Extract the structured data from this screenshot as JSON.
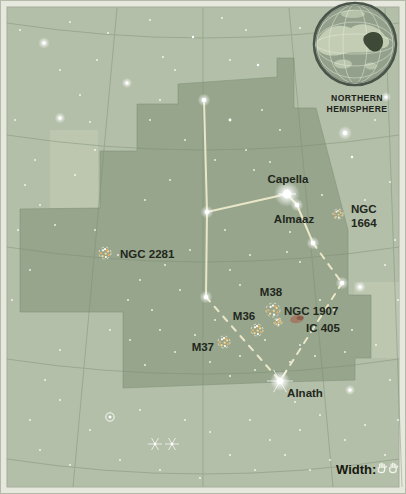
{
  "page": {
    "width": 406,
    "height": 494
  },
  "colors": {
    "frame": "#e6e8de",
    "frame_edge": "#b4b9aa",
    "map_bg": "#b4bfa9",
    "region_fill": "#96a58c",
    "region_edge": "#83947b",
    "light_patch": "#c4cdb6",
    "grid": "#7c8f74",
    "figure_line": "#f4eecf",
    "label_text": "#22271c",
    "star": "#ffffff",
    "cluster_dot_warm": "#ffd98e",
    "cluster_dot_deep": "#f2ae55",
    "cluster_ring": "#f0ead0",
    "nebula": "#a4735f",
    "inset_ring": "#49544a",
    "inset_ocean": "#93a28c",
    "inset_land": "#c6d0b6",
    "inset_marker": "#333f2c",
    "inset_graticule": "#e8edda",
    "hand": "#f2f4ec"
  },
  "map": {
    "region_points": [
      [
        178,
        84
      ],
      [
        277,
        77
      ],
      [
        277,
        58
      ],
      [
        294,
        58
      ],
      [
        294,
        108
      ],
      [
        316,
        108
      ],
      [
        348,
        230
      ],
      [
        348,
        295
      ],
      [
        371,
        295
      ],
      [
        371,
        358
      ],
      [
        355,
        358
      ],
      [
        355,
        380
      ],
      [
        280,
        382
      ],
      [
        123,
        388
      ],
      [
        123,
        312
      ],
      [
        20,
        312
      ],
      [
        20,
        209
      ],
      [
        100,
        208
      ],
      [
        100,
        151
      ],
      [
        137,
        151
      ],
      [
        137,
        104
      ],
      [
        178,
        104
      ]
    ],
    "light_patches": [
      {
        "x": 50,
        "y": 130,
        "w": 48,
        "h": 78
      },
      {
        "x": 354,
        "y": 282,
        "w": 45,
        "h": 76
      }
    ],
    "grid": {
      "dec_arc_sag_y": [
        38,
        150,
        262,
        374,
        474
      ],
      "arc_rise": 15,
      "arc_center_x": 203,
      "ra_lines": [
        [
          117,
          8,
          73,
          487
        ],
        [
          203,
          8,
          203,
          487
        ],
        [
          289,
          8,
          333,
          487
        ],
        [
          385,
          8,
          402,
          487
        ]
      ]
    },
    "figure_lines": {
      "solid": [
        [
          [
            204,
            100
          ],
          [
            207,
            212
          ]
        ],
        [
          [
            207,
            212
          ],
          [
            206,
            297
          ]
        ],
        [
          [
            207,
            212
          ],
          [
            287,
            194
          ]
        ],
        [
          [
            287,
            194
          ],
          [
            297,
            205
          ]
        ],
        [
          [
            297,
            205
          ],
          [
            313,
            243
          ]
        ]
      ],
      "dashed": [
        [
          [
            206,
            297
          ],
          [
            280,
            381
          ]
        ],
        [
          [
            313,
            243
          ],
          [
            342,
            283
          ]
        ],
        [
          [
            342,
            283
          ],
          [
            280,
            381
          ]
        ]
      ]
    },
    "labels": [
      {
        "id": "capella",
        "text": "Capella",
        "x": 288,
        "y": 183,
        "anchor": "middle"
      },
      {
        "id": "almaaz",
        "text": "Almaaz",
        "x": 294,
        "y": 223,
        "anchor": "middle"
      },
      {
        "id": "ngc1664-line1",
        "text": "NGC",
        "x": 351,
        "y": 213,
        "anchor": "start"
      },
      {
        "id": "ngc1664-line2",
        "text": "1664",
        "x": 351,
        "y": 227,
        "anchor": "start"
      },
      {
        "id": "ngc2281",
        "text": "NGC 2281",
        "x": 120,
        "y": 258,
        "anchor": "start"
      },
      {
        "id": "m38",
        "text": "M38",
        "x": 271,
        "y": 296,
        "anchor": "middle"
      },
      {
        "id": "m36",
        "text": "M36",
        "x": 244,
        "y": 320,
        "anchor": "middle"
      },
      {
        "id": "m37",
        "text": "M37",
        "x": 214,
        "y": 351,
        "anchor": "end"
      },
      {
        "id": "ngc1907",
        "text": "NGC 1907",
        "x": 284,
        "y": 315,
        "anchor": "start"
      },
      {
        "id": "ic405",
        "text": "IC 405",
        "x": 306,
        "y": 332,
        "anchor": "start"
      },
      {
        "id": "alnath",
        "text": "Alnath",
        "x": 305,
        "y": 397,
        "anchor": "middle"
      }
    ],
    "named_stars": [
      {
        "name": "capella",
        "x": 287,
        "y": 194,
        "type": "major"
      },
      {
        "name": "almaaz",
        "x": 297,
        "y": 205,
        "type": "bright"
      },
      {
        "name": "eta-aur",
        "x": 313,
        "y": 243,
        "type": "bright"
      },
      {
        "name": "iota-aur",
        "x": 342,
        "y": 283,
        "type": "bright"
      },
      {
        "name": "delta-aur",
        "x": 204,
        "y": 100,
        "type": "bright"
      },
      {
        "name": "menkalinan",
        "x": 207,
        "y": 212,
        "type": "bright"
      },
      {
        "name": "theta-aur",
        "x": 206,
        "y": 297,
        "type": "bright"
      },
      {
        "name": "alnath",
        "x": 280,
        "y": 381,
        "type": "major-spiked"
      }
    ],
    "stars": [
      [
        20,
        30,
        1
      ],
      [
        44,
        43,
        1.8
      ],
      [
        70,
        22,
        1
      ],
      [
        97,
        60,
        1
      ],
      [
        108,
        33,
        1
      ],
      [
        127,
        83,
        1.6
      ],
      [
        150,
        20,
        1
      ],
      [
        163,
        57,
        1
      ],
      [
        193,
        37,
        1.2
      ],
      [
        222,
        18,
        1
      ],
      [
        246,
        30,
        1
      ],
      [
        258,
        65,
        1.2
      ],
      [
        300,
        28,
        1
      ],
      [
        230,
        60,
        1
      ],
      [
        175,
        70,
        1
      ],
      [
        60,
        70,
        1
      ],
      [
        15,
        120,
        1
      ],
      [
        35,
        160,
        1
      ],
      [
        18,
        230,
        1
      ],
      [
        60,
        118,
        1.7
      ],
      [
        80,
        95,
        1
      ],
      [
        30,
        270,
        1
      ],
      [
        12,
        300,
        1
      ],
      [
        55,
        225,
        1
      ],
      [
        90,
        122,
        1
      ],
      [
        75,
        175,
        1
      ],
      [
        40,
        205,
        1
      ],
      [
        25,
        185,
        1
      ],
      [
        95,
        150,
        1
      ],
      [
        150,
        120,
        1
      ],
      [
        185,
        140,
        1
      ],
      [
        230,
        120,
        1.4
      ],
      [
        262,
        110,
        1
      ],
      [
        280,
        130,
        1
      ],
      [
        215,
        160,
        1
      ],
      [
        246,
        150,
        1
      ],
      [
        170,
        180,
        1
      ],
      [
        145,
        200,
        1
      ],
      [
        254,
        170,
        1
      ],
      [
        270,
        162,
        1
      ],
      [
        160,
        100,
        1
      ],
      [
        322,
        195,
        1
      ],
      [
        305,
        180,
        1
      ],
      [
        290,
        232,
        1
      ],
      [
        287,
        252,
        1
      ],
      [
        300,
        262,
        1
      ],
      [
        320,
        300,
        1
      ],
      [
        334,
        310,
        1
      ],
      [
        360,
        287,
        1.8
      ],
      [
        352,
        330,
        1
      ],
      [
        345,
        352,
        1
      ],
      [
        365,
        200,
        1
      ],
      [
        390,
        182,
        1
      ],
      [
        395,
        240,
        1
      ],
      [
        385,
        265,
        1
      ],
      [
        398,
        300,
        1
      ],
      [
        386,
        97,
        1.6
      ],
      [
        345,
        133,
        2.2
      ],
      [
        352,
        157,
        1.2
      ],
      [
        375,
        120,
        1
      ],
      [
        225,
        230,
        1
      ],
      [
        190,
        250,
        1
      ],
      [
        165,
        265,
        1
      ],
      [
        180,
        290,
        1
      ],
      [
        152,
        310,
        1
      ],
      [
        140,
        280,
        1
      ],
      [
        118,
        255,
        1
      ],
      [
        128,
        300,
        1
      ],
      [
        95,
        230,
        1
      ],
      [
        230,
        270,
        1
      ],
      [
        250,
        255,
        1
      ],
      [
        240,
        285,
        1
      ],
      [
        215,
        320,
        1
      ],
      [
        195,
        335,
        1
      ],
      [
        175,
        352,
        1
      ],
      [
        160,
        330,
        1
      ],
      [
        210,
        362,
        1
      ],
      [
        240,
        356,
        1
      ],
      [
        255,
        370,
        1
      ],
      [
        230,
        376,
        1
      ],
      [
        265,
        340,
        1
      ],
      [
        300,
        345,
        1
      ],
      [
        315,
        356,
        1
      ],
      [
        290,
        362,
        1
      ],
      [
        130,
        340,
        1
      ],
      [
        110,
        330,
        1
      ],
      [
        145,
        365,
        1
      ],
      [
        60,
        400,
        1
      ],
      [
        90,
        430,
        1
      ],
      [
        140,
        410,
        1
      ],
      [
        185,
        420,
        1
      ],
      [
        210,
        432,
        1
      ],
      [
        230,
        455,
        1
      ],
      [
        250,
        420,
        1
      ],
      [
        270,
        440,
        1
      ],
      [
        300,
        430,
        1
      ],
      [
        320,
        415,
        1
      ],
      [
        345,
        440,
        1
      ],
      [
        365,
        425,
        1
      ],
      [
        385,
        455,
        1
      ],
      [
        40,
        450,
        1
      ],
      [
        70,
        465,
        1
      ],
      [
        120,
        460,
        1
      ],
      [
        160,
        470,
        1
      ],
      [
        200,
        478,
        1
      ],
      [
        255,
        470,
        1
      ],
      [
        60,
        350,
        1
      ],
      [
        45,
        380,
        1
      ],
      [
        30,
        420,
        1
      ],
      [
        350,
        390,
        1.6
      ],
      [
        330,
        460,
        1
      ],
      [
        295,
        402,
        1
      ],
      [
        376,
        345,
        1
      ],
      [
        398,
        420,
        1
      ],
      [
        390,
        380,
        1
      ],
      [
        310,
        470,
        1
      ],
      [
        285,
        455,
        1
      ]
    ],
    "special_stars": {
      "spiked": [
        [
          155,
          444
        ],
        [
          172,
          444
        ]
      ],
      "ringed": [
        [
          110,
          417
        ]
      ]
    },
    "clusters": [
      {
        "id": "ngc2281",
        "cx": 105,
        "cy": 253,
        "r": 6
      },
      {
        "id": "m38",
        "cx": 273,
        "cy": 310,
        "r": 7
      },
      {
        "id": "m36",
        "cx": 257,
        "cy": 330,
        "r": 6
      },
      {
        "id": "m37",
        "cx": 224,
        "cy": 342,
        "r": 6
      },
      {
        "id": "ngc1907",
        "cx": 278,
        "cy": 322,
        "r": 4
      },
      {
        "id": "ngc1664",
        "cx": 338,
        "cy": 214,
        "r": 5
      }
    ],
    "nebulae": [
      {
        "id": "ic405",
        "x": 297,
        "y": 319,
        "w": 14,
        "h": 8
      }
    ]
  },
  "inset": {
    "cx": 355,
    "cy": 44,
    "r": 41,
    "title_line1": "NORTHERN",
    "title_line2": "HEMISPHERE"
  },
  "width_indicator": {
    "label": "Width:",
    "hand_icon_count": 2
  }
}
